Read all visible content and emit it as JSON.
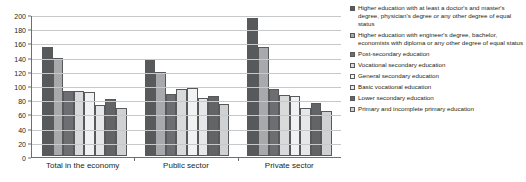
{
  "chart_data": {
    "type": "bar",
    "title": "",
    "xlabel": "",
    "ylabel": "",
    "ylim": [
      0,
      200
    ],
    "ytick_step": 20,
    "grid": true,
    "legend_position": "right",
    "categories": [
      "Total in the economy",
      "Public sector",
      "Private sector"
    ],
    "yticks": [
      "200",
      "180",
      "160",
      "140",
      "120",
      "100",
      "80",
      "60",
      "40",
      "20",
      "0"
    ],
    "series": [
      {
        "name": "Higher education with at least a doctor's and master's degree, physician's degree or any other degree of equal status",
        "color": "#58595b",
        "values": [
          153,
          136,
          194
        ]
      },
      {
        "name": "Higher education with engineer's degree, bachelor, economists with diploma or any other degree of equal status",
        "color": "#a7a9ac",
        "values": [
          138,
          118,
          153
        ]
      },
      {
        "name": "Post-secondary education",
        "color": "#6d6e71",
        "values": [
          91,
          87,
          94
        ]
      },
      {
        "name": "Vocational secondary education",
        "color": "#d9dadb",
        "values": [
          91,
          95,
          86
        ]
      },
      {
        "name": "General secondary education",
        "color": "#f1f2f2",
        "values": [
          90,
          96,
          85
        ]
      },
      {
        "name": "Basic vocational education",
        "color": "#e6e7e8",
        "values": [
          72,
          82,
          67
        ]
      },
      {
        "name": "Lower secondary education",
        "color": "#636466",
        "values": [
          81,
          85,
          75
        ]
      },
      {
        "name": "Primary and incomplete primary education",
        "color": "#cfd1d2",
        "values": [
          68,
          73,
          64
        ]
      }
    ]
  }
}
